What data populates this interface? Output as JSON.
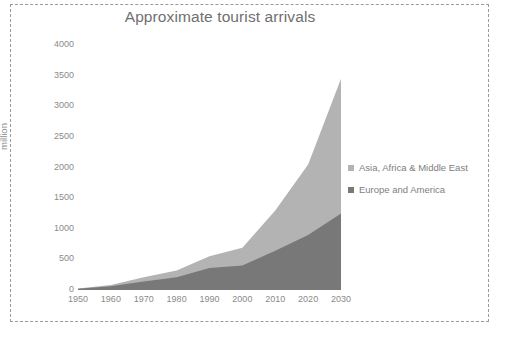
{
  "chart_data": {
    "type": "area",
    "stacked": true,
    "title": "Approximate tourist arrivals",
    "xlabel": "",
    "ylabel": "million",
    "x": [
      1950,
      1960,
      1970,
      1980,
      1990,
      2000,
      2010,
      2020,
      2030
    ],
    "xtick_labels": [
      "1950",
      "1960",
      "1970",
      "1980",
      "1990",
      "2000",
      "2010",
      "2020",
      "2030"
    ],
    "ytick_labels": [
      "0",
      "500",
      "1000",
      "1500",
      "2000",
      "2500",
      "3000",
      "3500",
      "4000"
    ],
    "ytick_values": [
      0,
      500,
      1000,
      1500,
      2000,
      2500,
      3000,
      3500,
      4000
    ],
    "xlim": [
      1950,
      2030
    ],
    "ylim": [
      0,
      4000
    ],
    "grid": false,
    "legend_position": "right",
    "series": [
      {
        "name": "Europe and America",
        "color": "#787878",
        "values": [
          20,
          60,
          140,
          210,
          360,
          400,
          640,
          900,
          1250
        ]
      },
      {
        "name": "Asia, Africa & Middle East",
        "color": "#b3b3b3",
        "values": [
          5,
          20,
          70,
          110,
          190,
          290,
          660,
          1150,
          2200
        ]
      }
    ],
    "stacked_totals": [
      25,
      80,
      210,
      320,
      550,
      690,
      1300,
      2050,
      3450
    ],
    "annotations": []
  },
  "legend": {
    "items": [
      {
        "label": "Asia, Africa & Middle East",
        "color": "#b3b3b3"
      },
      {
        "label": "Europe and America",
        "color": "#787878"
      }
    ]
  },
  "colors": {
    "series_light": "#b3b3b3",
    "series_dark": "#787878",
    "text": "#8a8a8a",
    "title": "#6f6f6f",
    "border": "#9a9a9a"
  }
}
